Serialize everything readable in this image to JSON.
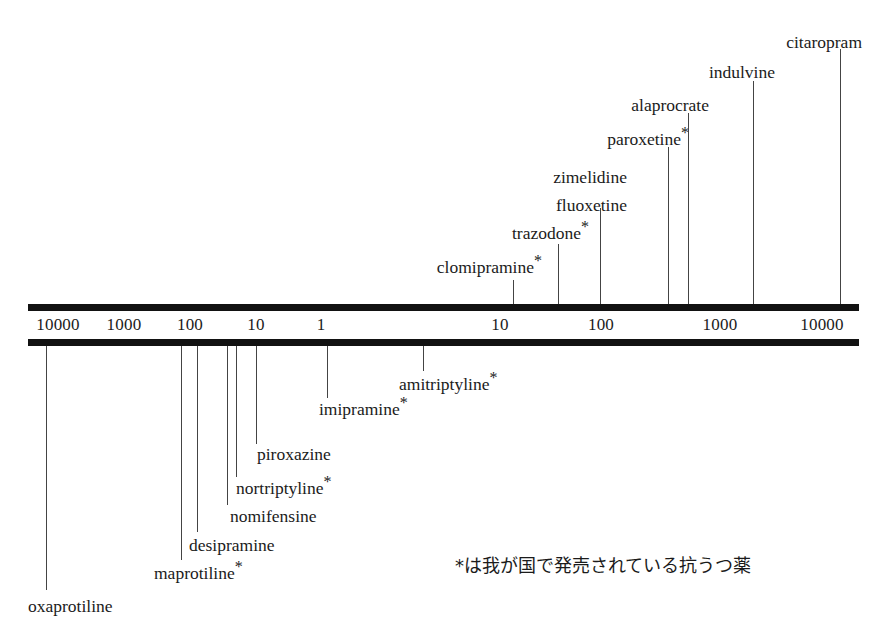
{
  "figure": {
    "ink_color": "#121212",
    "leader_color": "#444444",
    "background": "#ffffff"
  },
  "axis": {
    "name": "double-bar-logarithmic-scale",
    "left_px": 28,
    "right_px": 859,
    "ticks": [
      {
        "label": "10000",
        "x": 58
      },
      {
        "label": "1000",
        "x": 124
      },
      {
        "label": "100",
        "x": 190
      },
      {
        "label": "10",
        "x": 256
      },
      {
        "label": "1",
        "x": 321
      },
      {
        "label": "10",
        "x": 500
      },
      {
        "label": "100",
        "x": 601
      },
      {
        "label": "1000",
        "x": 720
      },
      {
        "label": "10000",
        "x": 822
      }
    ]
  },
  "footnote": {
    "text": "*は我が国で発売されている抗うつ薬",
    "x": 455,
    "y": 555
  },
  "chart_data": {
    "type": "scatter",
    "xlabel": "",
    "ylabel": "",
    "scale": "logarithmic-bidirectional",
    "axis_tick_labels": [
      "10000",
      "1000",
      "100",
      "10",
      "1",
      "10",
      "100",
      "1000",
      "10000"
    ],
    "legend": [
      "*は我が国で発売されている抗うつ薬"
    ],
    "series": [
      {
        "name": "upper",
        "values": [
          {
            "label": "clomipramine",
            "starred": true,
            "text": "clomipramine",
            "tick_x": 513,
            "label_x": 542,
            "label_y": 258,
            "line_top": 280
          },
          {
            "label": "trazodone",
            "starred": true,
            "text": "trazodone",
            "tick_x": 558,
            "label_x": 589,
            "label_y": 224,
            "line_top": 244
          },
          {
            "label": "fluoxetine",
            "starred": false,
            "text": "fluoxetine",
            "tick_x": 600,
            "label_x": 627,
            "label_y": 196,
            "line_top": 208
          },
          {
            "label": "zimelidine",
            "starred": false,
            "text": "zimelidine",
            "tick_x": 600,
            "label_x": 627,
            "label_y": 168,
            "line_top": 208
          },
          {
            "label": "paroxetine",
            "starred": true,
            "text": "paroxetine",
            "tick_x": 668,
            "label_x": 689,
            "label_y": 130,
            "line_top": 147
          },
          {
            "label": "alaprocrate",
            "starred": false,
            "text": "alaprocrate",
            "tick_x": 688,
            "label_x": 709,
            "label_y": 96,
            "line_top": 113
          },
          {
            "label": "indulvine",
            "starred": false,
            "text": "indulvine",
            "tick_x": 753,
            "label_x": 775,
            "label_y": 63,
            "line_top": 81
          },
          {
            "label": "citaropram",
            "starred": false,
            "text": "citaropram",
            "tick_x": 840,
            "label_x": 862,
            "label_y": 33,
            "line_top": 49
          }
        ]
      },
      {
        "name": "lower",
        "values": [
          {
            "label": "amitriptyline",
            "starred": true,
            "text": "amitriptyline",
            "tick_x": 423,
            "label_x": 399,
            "label_y": 375,
            "line_bottom": 371
          },
          {
            "label": "imipramine",
            "starred": true,
            "text": "imipramine",
            "tick_x": 327,
            "label_x": 319,
            "label_y": 400,
            "line_bottom": 398
          },
          {
            "label": "piroxazine",
            "starred": false,
            "text": "piroxazine",
            "tick_x": 256,
            "label_x": 257,
            "label_y": 445,
            "line_bottom": 444
          },
          {
            "label": "nortriptyline",
            "starred": true,
            "text": "nortriptyline",
            "tick_x": 236,
            "label_x": 236,
            "label_y": 479,
            "line_bottom": 477
          },
          {
            "label": "nomifensine",
            "starred": false,
            "text": "nomifensine",
            "tick_x": 227,
            "label_x": 230,
            "label_y": 507,
            "line_bottom": 505
          },
          {
            "label": "desipramine",
            "starred": false,
            "text": "desipramine",
            "tick_x": 197,
            "label_x": 189,
            "label_y": 536,
            "line_bottom": 532
          },
          {
            "label": "maprotiline",
            "starred": true,
            "text": "maprotiline",
            "tick_x": 181,
            "label_x": 154,
            "label_y": 564,
            "line_bottom": 560
          },
          {
            "label": "oxaprotiline",
            "starred": false,
            "text": "oxaprotiline",
            "tick_x": 46,
            "label_x": 28,
            "label_y": 597,
            "line_bottom": 590
          }
        ]
      }
    ]
  }
}
